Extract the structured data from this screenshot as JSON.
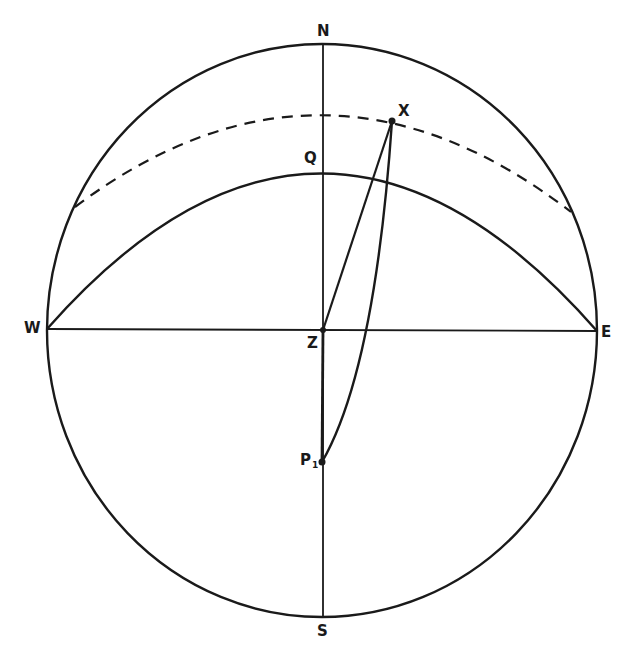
{
  "diagram": {
    "type": "celestial-sphere-projection",
    "stroke_color": "#1a1a1a",
    "background": "#ffffff",
    "labels": {
      "N": "N",
      "S": "S",
      "E": "E",
      "W": "W",
      "Z": "Z",
      "Q": "Q",
      "X": "X",
      "P": "P",
      "P_sub": "1"
    },
    "points": {
      "N": [
        323,
        44
      ],
      "S": [
        323,
        617
      ],
      "W": [
        47,
        329
      ],
      "E": [
        597,
        331
      ],
      "Z": [
        323,
        330
      ],
      "Q": [
        323,
        173
      ],
      "X": [
        392,
        121
      ],
      "P1": [
        322,
        462
      ]
    },
    "elements": [
      {
        "name": "outer-circle",
        "kind": "ellipse",
        "style": "solid"
      },
      {
        "name": "meridian-N-S",
        "kind": "line",
        "from": "N",
        "to": "S",
        "style": "solid"
      },
      {
        "name": "horizon-W-E",
        "kind": "line",
        "from": "W",
        "to": "E",
        "style": "solid"
      },
      {
        "name": "equator-arc-W-Q-E",
        "kind": "arc",
        "through": [
          "W",
          "Q",
          "E"
        ],
        "style": "solid"
      },
      {
        "name": "parallel-arc-through-X",
        "kind": "arc",
        "through": [
          [
            75,
            207
          ],
          [
            323,
            114
          ],
          [
            571,
            212
          ]
        ],
        "style": "dashed"
      },
      {
        "name": "vertical-circle-Z-X",
        "kind": "line",
        "from": "Z",
        "to": "X",
        "style": "solid"
      },
      {
        "name": "hour-circle-P1-X",
        "kind": "arc",
        "from": "P1",
        "to": "X",
        "style": "solid"
      }
    ]
  }
}
